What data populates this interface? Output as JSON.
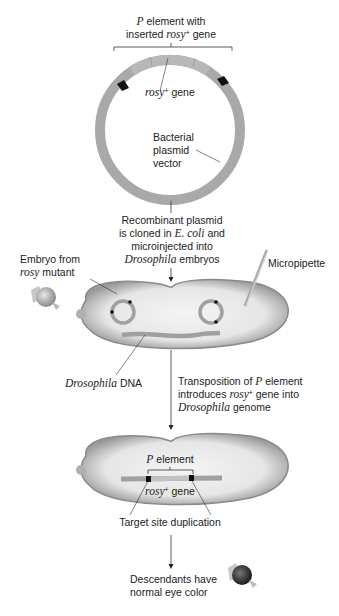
{
  "labels": {
    "p_element_top_1_italic": "P",
    "p_element_top_1_text": " element with",
    "p_element_top_2_text": "inserted ",
    "p_element_top_2_italic": "rosy",
    "p_element_top_2_sup": "+",
    "p_element_top_2_end": " gene",
    "rosy_gene_italic": "rosy",
    "rosy_gene_sup": "+",
    "rosy_gene_text": " gene",
    "plasmid_1": "Bacterial",
    "plasmid_2": "plasmid",
    "plasmid_3": "vector",
    "step1_1": "Recombinant plasmid",
    "step1_2a": "is cloned in ",
    "step1_2_italic": "E. coli",
    "step1_2b": " and",
    "step1_3": "microinjected into",
    "step1_4_italic": "Drosophila",
    "step1_4b": " embryos",
    "embryo_1": "Embryo from",
    "embryo_2_italic": "rosy",
    "embryo_2b": " mutant",
    "micropipette": "Micropipette",
    "dros_dna_italic": "Drosophila",
    "dros_dna_text": " DNA",
    "step2_1a": "Transposition of ",
    "step2_1_italic": "P",
    "step2_1b": " element",
    "step2_2a": "introduces ",
    "step2_2_italic": "rosy",
    "step2_2_sup": "+",
    "step2_2b": " gene into",
    "step2_3_italic": "Drosophila",
    "step2_3b": " genome",
    "p_element_mid_italic": "P",
    "p_element_mid_text": " element",
    "rosy_mid_italic": "rosy",
    "rosy_mid_sup": "+",
    "rosy_mid_text": " gene",
    "target_site": "Target site duplication",
    "desc_1": "Descendants have",
    "desc_2": "normal eye color"
  },
  "colors": {
    "plasmid_ring": "#a9a9a9",
    "embryo_fill": "#e8e8e8",
    "embryo_edge": "#8a8a8a",
    "marker": "#111111",
    "eye_mutant": "#b5b5b5",
    "eye_normal": "#3a3a3a"
  }
}
